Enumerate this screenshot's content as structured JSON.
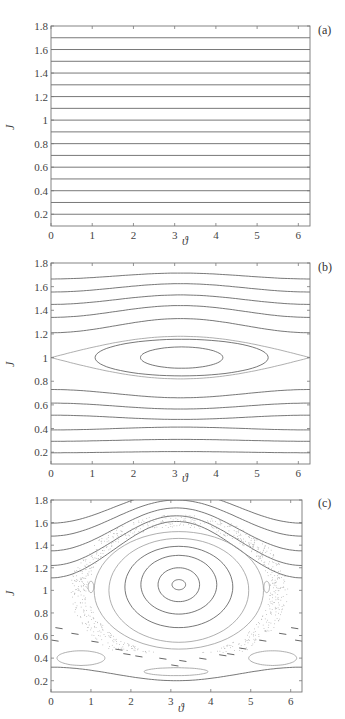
{
  "chart_data": [
    {
      "type": "line",
      "panel_label": "(a)",
      "title": "",
      "xlabel": "ϑ",
      "ylabel": "J",
      "xlim": [
        0,
        6.283
      ],
      "ylim": [
        0.1,
        1.8
      ],
      "xticks": [
        "0",
        "1",
        "2",
        "3",
        "4",
        "5",
        "6"
      ],
      "yticks": [
        "0.2",
        "0.4",
        "0.6",
        "0.8",
        "1",
        "1.2",
        "1.4",
        "1.6",
        "1.8"
      ],
      "grid": false,
      "description": "Unperturbed phase portrait: straight horizontal invariant lines",
      "series": [
        {
          "name": "J=0.2",
          "kind": "flat",
          "J": 0.2
        },
        {
          "name": "J=0.3",
          "kind": "flat",
          "J": 0.3
        },
        {
          "name": "J=0.4",
          "kind": "flat",
          "J": 0.4
        },
        {
          "name": "J=0.5",
          "kind": "flat",
          "J": 0.5
        },
        {
          "name": "J=0.6",
          "kind": "flat",
          "J": 0.6
        },
        {
          "name": "J=0.7",
          "kind": "flat",
          "J": 0.7
        },
        {
          "name": "J=0.8",
          "kind": "flat",
          "J": 0.8
        },
        {
          "name": "J=0.9",
          "kind": "flat",
          "J": 0.9
        },
        {
          "name": "J=1.0",
          "kind": "flat",
          "J": 1.0
        },
        {
          "name": "J=1.1",
          "kind": "flat",
          "J": 1.1
        },
        {
          "name": "J=1.2",
          "kind": "flat",
          "J": 1.2
        },
        {
          "name": "J=1.3",
          "kind": "flat",
          "J": 1.3
        },
        {
          "name": "J=1.4",
          "kind": "flat",
          "J": 1.4
        },
        {
          "name": "J=1.5",
          "kind": "flat",
          "J": 1.5
        },
        {
          "name": "J=1.6",
          "kind": "flat",
          "J": 1.6
        },
        {
          "name": "J=1.7",
          "kind": "flat",
          "J": 1.7
        }
      ]
    },
    {
      "type": "line",
      "panel_label": "(b)",
      "title": "",
      "xlabel": "ϑ",
      "ylabel": "J",
      "xlim": [
        0,
        6.283
      ],
      "ylim": [
        0.1,
        1.8
      ],
      "xticks": [
        "0",
        "1",
        "2",
        "3",
        "4",
        "5",
        "6"
      ],
      "yticks": [
        "0.2",
        "0.4",
        "0.6",
        "0.8",
        "1",
        "1.2",
        "1.4",
        "1.6",
        "1.8"
      ],
      "grid": false,
      "description": "Pendulum-like resonance island centered at (π, 1) with separatrix",
      "series": [
        {
          "name": "rot-0.2",
          "kind": "wave",
          "J0": 0.2,
          "amp": 0.005
        },
        {
          "name": "rot-0.3",
          "kind": "wave",
          "J0": 0.3,
          "amp": 0.008
        },
        {
          "name": "rot-0.4",
          "kind": "wave",
          "J0": 0.4,
          "amp": 0.012
        },
        {
          "name": "rot-0.5",
          "kind": "wave",
          "J0": 0.495,
          "amp": -0.018
        },
        {
          "name": "rot-0.6",
          "kind": "wave",
          "J0": 0.59,
          "amp": -0.025
        },
        {
          "name": "rot-0.7",
          "kind": "wave",
          "J0": 0.695,
          "amp": -0.035
        },
        {
          "name": "rot-1.2",
          "kind": "wave",
          "J0": 1.27,
          "amp": 0.06
        },
        {
          "name": "rot-1.35",
          "kind": "wave",
          "J0": 1.39,
          "amp": 0.05
        },
        {
          "name": "rot-1.47",
          "kind": "wave",
          "J0": 1.49,
          "amp": 0.04
        },
        {
          "name": "rot-1.58",
          "kind": "wave",
          "J0": 1.59,
          "amp": 0.035
        },
        {
          "name": "rot-1.69",
          "kind": "wave",
          "J0": 1.69,
          "amp": 0.025
        },
        {
          "name": "separatrix",
          "kind": "separatrix",
          "center": 3.14,
          "J": 1.0,
          "width": 0.18
        },
        {
          "name": "island-outer",
          "kind": "ellipse",
          "cx": 3.17,
          "cy": 1.0,
          "rx": 2.1,
          "ry": 0.155
        },
        {
          "name": "island-inner",
          "kind": "ellipse",
          "cx": 3.17,
          "cy": 1.0,
          "rx": 1.0,
          "ry": 0.09
        }
      ]
    },
    {
      "type": "line",
      "panel_label": "(c)",
      "title": "",
      "xlabel": "ϑ",
      "ylabel": "J",
      "xlim": [
        0,
        6.283
      ],
      "ylim": [
        0.1,
        1.8
      ],
      "xticks": [
        "0",
        "1",
        "2",
        "3",
        "4",
        "5",
        "6"
      ],
      "yticks": [
        "0.2",
        "0.4",
        "0.6",
        "0.8",
        "1",
        "1.2",
        "1.4",
        "1.6",
        "1.8"
      ],
      "grid": false,
      "description": "Strongly perturbed phase portrait: large island centered near (3.2, 1.05), chaotic layer, secondary island chains",
      "series": [
        {
          "name": "top-rot-1",
          "kind": "wave",
          "J0": 1.735,
          "amp": 0.14
        },
        {
          "name": "top-rot-2",
          "kind": "wave",
          "J0": 1.64,
          "amp": 0.16
        },
        {
          "name": "top-rot-3",
          "kind": "wave",
          "J0": 1.54,
          "amp": 0.19
        },
        {
          "name": "top-rot-4",
          "kind": "wave",
          "J0": 1.44,
          "amp": 0.22
        },
        {
          "name": "top-rot-5",
          "kind": "wave",
          "J0": 1.36,
          "amp": 0.25
        },
        {
          "name": "bottom-rot",
          "kind": "wave",
          "J0": 0.26,
          "amp": -0.06
        },
        {
          "name": "island-1",
          "kind": "ellipse",
          "cx": 3.2,
          "cy": 1.05,
          "rx": 0.17,
          "ry": 0.045
        },
        {
          "name": "island-2",
          "kind": "ellipse",
          "cx": 3.2,
          "cy": 1.05,
          "rx": 0.52,
          "ry": 0.15
        },
        {
          "name": "island-3",
          "kind": "ellipse",
          "cx": 3.2,
          "cy": 1.05,
          "rx": 0.95,
          "ry": 0.26
        },
        {
          "name": "island-4",
          "kind": "ellipse",
          "cx": 3.2,
          "cy": 1.03,
          "rx": 1.35,
          "ry": 0.36
        },
        {
          "name": "island-5",
          "kind": "ellipse",
          "cx": 3.2,
          "cy": 1.0,
          "rx": 1.75,
          "ry": 0.46
        },
        {
          "name": "island-6",
          "kind": "ellipse",
          "cx": 3.2,
          "cy": 1.0,
          "rx": 2.12,
          "ry": 0.52
        },
        {
          "name": "lower-island-left",
          "kind": "ellipse",
          "cx": 0.75,
          "cy": 0.4,
          "rx": 0.6,
          "ry": 0.065
        },
        {
          "name": "lower-island-right",
          "kind": "ellipse",
          "cx": 5.55,
          "cy": 0.4,
          "rx": 0.6,
          "ry": 0.065
        },
        {
          "name": "lower-island-center",
          "kind": "ellipse",
          "cx": 3.13,
          "cy": 0.28,
          "rx": 0.8,
          "ry": 0.035
        },
        {
          "name": "small-island-left",
          "kind": "ellipse",
          "cx": 1.0,
          "cy": 1.03,
          "rx": 0.07,
          "ry": 0.05
        },
        {
          "name": "small-island-right",
          "kind": "ellipse",
          "cx": 5.4,
          "cy": 1.03,
          "rx": 0.07,
          "ry": 0.05
        }
      ]
    }
  ],
  "panels": [
    {
      "label": "(a)",
      "xlabel": "ϑ",
      "ylabel": "J"
    },
    {
      "label": "(b)",
      "xlabel": "ϑ",
      "ylabel": "J"
    },
    {
      "label": "(c)",
      "xlabel": "ϑ",
      "ylabel": "J"
    }
  ],
  "colors": {
    "axis": "#777777",
    "curve": "#555555",
    "curve_light": "#9a9a9a",
    "chaos": "#b0b0b0"
  }
}
